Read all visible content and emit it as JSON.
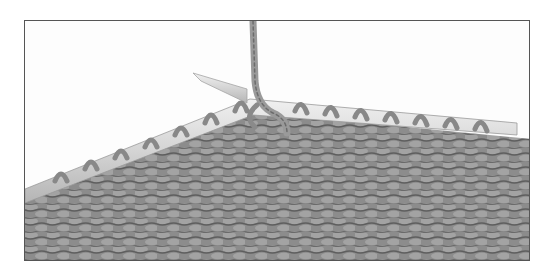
{
  "image": {
    "description": "Grayscale photograph of garter stitch knitting with stitches on a knitting needle and a working yarn strand rising vertically",
    "alt": "Knitting stitches on needle with working yarn",
    "colors": {
      "background": "#fdfdfd",
      "frame_border": "#555555",
      "fabric": "#8c8c8c",
      "fabric_shadow": "#5e5e5e",
      "needle": "#d9d9d9",
      "yarn": "#9a9a9a"
    }
  }
}
